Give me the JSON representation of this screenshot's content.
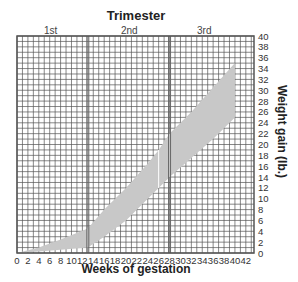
{
  "chart_data": {
    "type": "area",
    "title": "Trimester",
    "xlabel": "Weeks of gestation",
    "ylabel": "Weight gain (lb.)",
    "xlim": [
      0,
      43.5
    ],
    "ylim": [
      0,
      40
    ],
    "x_ticks": [
      0,
      2,
      4,
      6,
      8,
      10,
      12,
      14,
      16,
      18,
      20,
      22,
      24,
      26,
      28,
      30,
      32,
      34,
      36,
      38,
      40,
      42
    ],
    "y_ticks": [
      0,
      2,
      4,
      6,
      8,
      10,
      12,
      14,
      16,
      18,
      20,
      22,
      24,
      26,
      28,
      30,
      32,
      34,
      36,
      38,
      40
    ],
    "grid": true,
    "trimesters": [
      {
        "label": "1st",
        "start_week": 0,
        "end_week": 13
      },
      {
        "label": "2nd",
        "start_week": 13,
        "end_week": 28
      },
      {
        "label": "3rd",
        "start_week": 28,
        "end_week": 43.5
      }
    ],
    "series": [
      {
        "name": "upper bound",
        "x": [
          0,
          4,
          8,
          13,
          16,
          20,
          24,
          26,
          28,
          32,
          36,
          40
        ],
        "values": [
          0,
          1,
          2.5,
          4.5,
          8,
          12,
          16.5,
          19,
          22,
          26,
          30.5,
          35
        ]
      },
      {
        "name": "lower bound",
        "x": [
          0,
          4,
          8,
          13,
          16,
          20,
          24,
          26,
          28,
          32,
          36,
          40
        ],
        "values": [
          0,
          0.3,
          0.6,
          1,
          3,
          6,
          10,
          12,
          14,
          17.5,
          21,
          25
        ]
      }
    ],
    "fill_color": "#c8c8c8",
    "grid_color": "#555555"
  },
  "labels": {
    "title": "Trimester",
    "trimesters": [
      "1st",
      "2nd",
      "3rd"
    ],
    "xlabel": "Weeks of gestation",
    "ylabel": "Weight gain (lb.)"
  }
}
